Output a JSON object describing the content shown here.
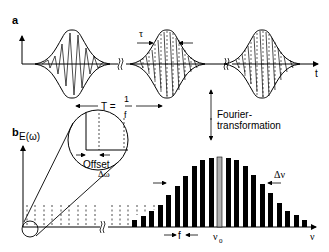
{
  "panel_a": {
    "label": "a",
    "time_axis_label": "t",
    "pulse_width_label": "τ",
    "period_label_T": "T =",
    "period_fraction_num": "1",
    "period_fraction_den": "f"
  },
  "transform": {
    "line1": "Fourier-",
    "line2": "transformation"
  },
  "panel_b": {
    "label": "b",
    "y_axis_label": "E(ω)",
    "inset_offset_label": "Offset",
    "inset_delta_label": "Δω",
    "x_axis_label": "ν",
    "center_freq_label": "ν",
    "center_freq_sub": "0",
    "spacing_label": "f",
    "bandwidth_label": "Δν"
  },
  "colors": {
    "ink": "#000000",
    "center_bar": "#b0b0b0",
    "background": "#ffffff"
  }
}
